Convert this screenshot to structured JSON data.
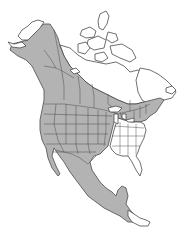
{
  "map": {
    "region": "North America",
    "type": "species range map",
    "legend": [],
    "colors": {
      "range_fill": "#b3b3b3",
      "non_range_fill": "#ffffff",
      "border": "#4a4a4a",
      "background": "#ffffff"
    },
    "range_areas": [
      "Alaska (except northwest coast)",
      "Yukon",
      "British Columbia",
      "Alberta",
      "Saskatchewan (southern)",
      "Manitoba (southern)",
      "Ontario (southern)",
      "Quebec (southern)",
      "Maritime provinces",
      "Western and central United States",
      "Northeastern United States",
      "Mexico",
      "Central America (northern)"
    ],
    "excluded_areas": [
      "Canadian Arctic Archipelago",
      "Nunavut / northern Canada",
      "Labrador",
      "Southeastern United States",
      "Florida",
      "Southern Central America"
    ]
  }
}
